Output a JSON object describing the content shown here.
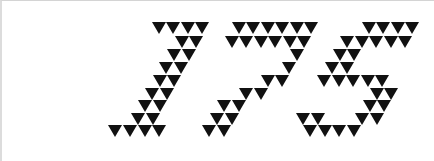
{
  "captcha": {
    "text": "175",
    "triangle_color": "#111111",
    "background_color": "#ffffff",
    "triangle": {
      "width": 14,
      "height": 12
    },
    "row_y": [
      22,
      36,
      49,
      62,
      75,
      88,
      100,
      113,
      125
    ],
    "glyphs": [
      {
        "char": "1",
        "rows": [
          [
            152,
            166,
            181,
            195
          ],
          [
            175,
            189
          ],
          [
            167,
            182
          ],
          [
            159,
            174
          ],
          [
            153,
            167
          ],
          [
            145,
            160
          ],
          [
            138,
            153
          ],
          [
            131,
            146
          ],
          [
            108,
            123,
            138,
            152
          ]
        ]
      },
      {
        "char": "7",
        "rows": [
          [
            232,
            246,
            261,
            275,
            290,
            304
          ],
          [
            225,
            239,
            254,
            268,
            283,
            297
          ],
          [
            290
          ],
          [
            282
          ],
          [
            261,
            275
          ],
          [
            239,
            254
          ],
          [
            217,
            232
          ],
          [
            210,
            225
          ],
          [
            202,
            217
          ]
        ]
      },
      {
        "char": "5",
        "rows": [
          [
            362,
            376,
            391,
            405
          ],
          [
            340,
            355,
            369,
            384,
            398
          ],
          [
            333,
            347
          ],
          [
            325,
            340
          ],
          [
            317,
            332,
            346,
            361,
            375
          ],
          [
            370,
            384
          ],
          [
            363,
            377
          ],
          [
            296,
            311,
            355,
            370
          ],
          [
            303,
            318,
            332,
            347
          ]
        ]
      }
    ]
  }
}
